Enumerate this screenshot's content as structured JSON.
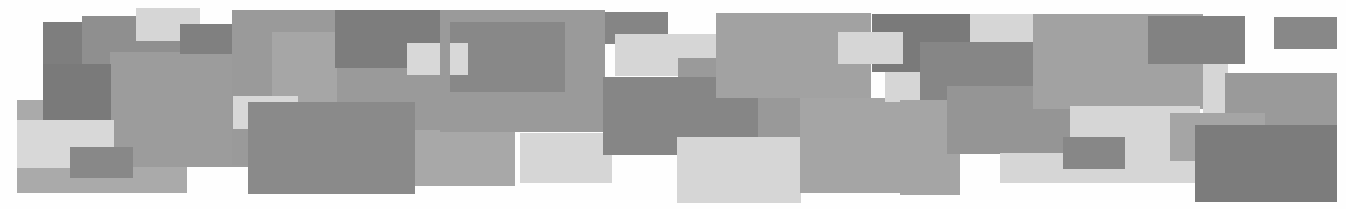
{
  "image": {
    "description": "Abstract mosaic of overlapping grayscale rectangles",
    "width": 1346,
    "height": 209,
    "background": "#fefefe"
  },
  "palette": {
    "dark": "#7a7a7a",
    "mid_dark": "#8a8a8a",
    "mid": "#9c9c9c",
    "mid_light": "#aaaaaa",
    "light": "#d6d6d6"
  },
  "rectangles": [
    {
      "x": 17,
      "y": 100,
      "w": 170,
      "h": 93,
      "color": "#aaaaaa"
    },
    {
      "x": 43,
      "y": 22,
      "w": 68,
      "h": 97,
      "color": "#7e7e7e"
    },
    {
      "x": 82,
      "y": 16,
      "w": 100,
      "h": 50,
      "color": "#8f8f8f"
    },
    {
      "x": 110,
      "y": 52,
      "w": 150,
      "h": 115,
      "color": "#9c9c9c"
    },
    {
      "x": 43,
      "y": 64,
      "w": 68,
      "h": 56,
      "color": "#7a7a7a"
    },
    {
      "x": 136,
      "y": 8,
      "w": 64,
      "h": 33,
      "color": "#d6d6d6"
    },
    {
      "x": 17,
      "y": 120,
      "w": 97,
      "h": 48,
      "color": "#d8d8d8"
    },
    {
      "x": 70,
      "y": 147,
      "w": 63,
      "h": 31,
      "color": "#888888"
    },
    {
      "x": 180,
      "y": 24,
      "w": 120,
      "h": 30,
      "color": "#808080"
    },
    {
      "x": 232,
      "y": 10,
      "w": 220,
      "h": 155,
      "color": "#9a9a9a"
    },
    {
      "x": 272,
      "y": 32,
      "w": 65,
      "h": 95,
      "color": "#a6a6a6"
    },
    {
      "x": 335,
      "y": 10,
      "w": 110,
      "h": 58,
      "color": "#7d7d7d"
    },
    {
      "x": 407,
      "y": 43,
      "w": 60,
      "h": 32,
      "color": "#d8d8d8"
    },
    {
      "x": 233,
      "y": 96,
      "w": 65,
      "h": 33,
      "color": "#d8d8d8"
    },
    {
      "x": 248,
      "y": 102,
      "w": 167,
      "h": 92,
      "color": "#8a8a8a"
    },
    {
      "x": 415,
      "y": 130,
      "w": 100,
      "h": 56,
      "color": "#a8a8a8"
    },
    {
      "x": 440,
      "y": 10,
      "w": 165,
      "h": 122,
      "color": "#9a9a9a"
    },
    {
      "x": 450,
      "y": 22,
      "w": 115,
      "h": 70,
      "color": "#888888"
    },
    {
      "x": 450,
      "y": 43,
      "w": 18,
      "h": 32,
      "color": "#d8d8d8"
    },
    {
      "x": 520,
      "y": 133,
      "w": 92,
      "h": 50,
      "color": "#d6d6d6"
    },
    {
      "x": 605,
      "y": 12,
      "w": 63,
      "h": 32,
      "color": "#858585"
    },
    {
      "x": 615,
      "y": 34,
      "w": 112,
      "h": 42,
      "color": "#d6d6d6"
    },
    {
      "x": 678,
      "y": 58,
      "w": 45,
      "h": 30,
      "color": "#9a9a9a"
    },
    {
      "x": 603,
      "y": 77,
      "w": 157,
      "h": 78,
      "color": "#868686"
    },
    {
      "x": 716,
      "y": 13,
      "w": 155,
      "h": 85,
      "color": "#a2a2a2"
    },
    {
      "x": 758,
      "y": 98,
      "w": 120,
      "h": 75,
      "color": "#999999"
    },
    {
      "x": 677,
      "y": 137,
      "w": 124,
      "h": 66,
      "color": "#d6d6d6"
    },
    {
      "x": 800,
      "y": 98,
      "w": 140,
      "h": 95,
      "color": "#a5a5a5"
    },
    {
      "x": 872,
      "y": 14,
      "w": 98,
      "h": 58,
      "color": "#7a7a7a"
    },
    {
      "x": 838,
      "y": 32,
      "w": 65,
      "h": 32,
      "color": "#d6d6d6"
    },
    {
      "x": 885,
      "y": 72,
      "w": 40,
      "h": 30,
      "color": "#d6d6d6"
    },
    {
      "x": 970,
      "y": 14,
      "w": 65,
      "h": 28,
      "color": "#d6d6d6"
    },
    {
      "x": 920,
      "y": 42,
      "w": 113,
      "h": 70,
      "color": "#868686"
    },
    {
      "x": 900,
      "y": 100,
      "w": 60,
      "h": 95,
      "color": "#a5a5a5"
    },
    {
      "x": 947,
      "y": 86,
      "w": 125,
      "h": 68,
      "color": "#959595"
    },
    {
      "x": 1033,
      "y": 14,
      "w": 170,
      "h": 95,
      "color": "#a2a2a2"
    },
    {
      "x": 1000,
      "y": 153,
      "w": 195,
      "h": 30,
      "color": "#d6d6d6"
    },
    {
      "x": 1070,
      "y": 106,
      "w": 130,
      "h": 50,
      "color": "#d6d6d6"
    },
    {
      "x": 1063,
      "y": 137,
      "w": 62,
      "h": 32,
      "color": "#878787"
    },
    {
      "x": 1148,
      "y": 16,
      "w": 97,
      "h": 48,
      "color": "#828282"
    },
    {
      "x": 1203,
      "y": 64,
      "w": 25,
      "h": 50,
      "color": "#d6d6d6"
    },
    {
      "x": 1225,
      "y": 73,
      "w": 112,
      "h": 55,
      "color": "#9a9a9a"
    },
    {
      "x": 1170,
      "y": 113,
      "w": 95,
      "h": 48,
      "color": "#a5a5a5"
    },
    {
      "x": 1195,
      "y": 125,
      "w": 142,
      "h": 77,
      "color": "#7c7c7c"
    },
    {
      "x": 1274,
      "y": 17,
      "w": 63,
      "h": 32,
      "color": "#888888"
    }
  ]
}
